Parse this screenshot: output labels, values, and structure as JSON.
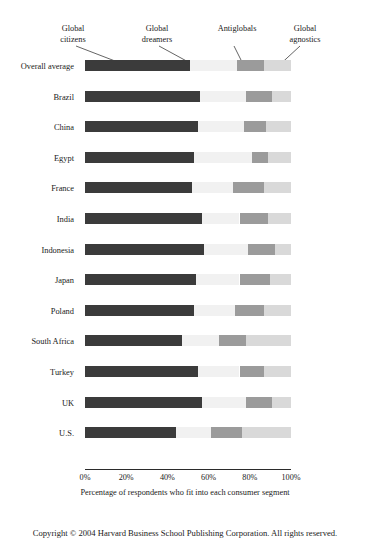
{
  "chart_data": {
    "type": "bar",
    "subtype": "stacked-horizontal-100-percent",
    "title": "",
    "xlabel": "Percentage of respondents who fit into each consumer segment",
    "ylabel": "",
    "xlim": [
      0,
      100
    ],
    "xticks": [
      0,
      20,
      40,
      60,
      80,
      100
    ],
    "xtick_labels": [
      "0%",
      "20%",
      "40%",
      "60%",
      "80%",
      "100%"
    ],
    "grid": false,
    "legend_position": "callouts-above-first-bar",
    "units": "percent",
    "categories": [
      "Overall average",
      "Brazil",
      "China",
      "Egypt",
      "France",
      "India",
      "Indonesia",
      "Japan",
      "Poland",
      "South Africa",
      "Turkey",
      "UK",
      "U.S."
    ],
    "series": [
      {
        "name": "Global citizens",
        "color": "#3b3b3b",
        "values": [
          51,
          56,
          55,
          53,
          52,
          57,
          58,
          54,
          53,
          47,
          55,
          57,
          44
        ]
      },
      {
        "name": "Global dreamers",
        "color": "#f1f1f1",
        "values": [
          23,
          22,
          22,
          28,
          20,
          18,
          21,
          21,
          20,
          18,
          20,
          21,
          17
        ]
      },
      {
        "name": "Antiglobals",
        "color": "#9b9b9b",
        "values": [
          13,
          13,
          11,
          8,
          15,
          14,
          13,
          15,
          14,
          13,
          12,
          13,
          15
        ]
      },
      {
        "name": "Global agnostics",
        "color": "#d9d9d9",
        "values": [
          13,
          9,
          12,
          11,
          13,
          11,
          8,
          10,
          13,
          22,
          13,
          9,
          24
        ]
      }
    ],
    "annotations": [
      {
        "label_line1": "Global",
        "label_line2": "citizens",
        "target_series": "Global citizens"
      },
      {
        "label_line1": "Global",
        "label_line2": "dreamers",
        "target_series": "Global dreamers"
      },
      {
        "label_line1": "Antiglobals",
        "label_line2": "",
        "target_series": "Antiglobals"
      },
      {
        "label_line1": "Global",
        "label_line2": "agnostics",
        "target_series": "Global agnostics"
      }
    ]
  },
  "caption": "Percentage of respondents who fit into each consumer segment",
  "copyright": "Copyright © 2004 Harvard Business School Publishing Corporation. All rights reserved."
}
